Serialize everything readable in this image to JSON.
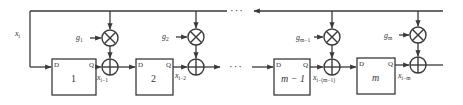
{
  "diagram": {
    "type": "block-diagram",
    "input": {
      "label": "x",
      "subscript": "i"
    },
    "continuation_symbol": "···",
    "stages": [
      {
        "block_label": "1",
        "pin_d": "D",
        "pin_q": "Q",
        "gain": "g",
        "gain_sub": "1",
        "output": "x",
        "output_sub": "i−1"
      },
      {
        "block_label": "2",
        "pin_d": "D",
        "pin_q": "Q",
        "gain": "g",
        "gain_sub": "2",
        "output": "x",
        "output_sub": "i−2"
      },
      {
        "block_label": "m − 1",
        "pin_d": "D",
        "pin_q": "Q",
        "gain": "g",
        "gain_sub": "m−1",
        "output": "x",
        "output_sub": "i−(m−1)"
      },
      {
        "block_label": "m",
        "pin_d": "D",
        "pin_q": "Q",
        "gain": "g",
        "gain_sub": "m",
        "output": "x",
        "output_sub": "i−m"
      }
    ],
    "operators": {
      "multiply": "⊗",
      "add": "⊕"
    },
    "colors": {
      "line": "#3a3a3a",
      "text": "#333333",
      "background": "#ffffff"
    }
  }
}
